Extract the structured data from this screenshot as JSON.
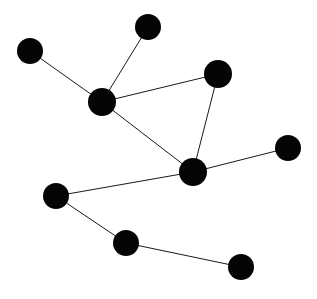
{
  "figure": {
    "type": "node-link-network-diagram",
    "width": 317,
    "height": 299,
    "background_color": "#ffffff",
    "node_color": "#050505",
    "edge_color": "#1a1a1a",
    "edge_width": 1,
    "node_count": 9,
    "edge_count": 9
  },
  "chart_data": {
    "type": "scatter",
    "title": "",
    "subtitle": "",
    "xlabel": "",
    "ylabel": "",
    "grid": false,
    "legend": "none",
    "xlim": [
      0,
      317
    ],
    "ylim": [
      0,
      299
    ],
    "graph_type": "undirected-network",
    "nodes": [
      {
        "id": "n1",
        "label": "",
        "x": 30,
        "y": 51,
        "r": 13,
        "degree": 1
      },
      {
        "id": "n2",
        "label": "",
        "x": 148,
        "y": 27,
        "r": 13,
        "degree": 1
      },
      {
        "id": "n3",
        "label": "",
        "x": 102,
        "y": 102,
        "r": 14,
        "degree": 4
      },
      {
        "id": "n4",
        "label": "",
        "x": 218,
        "y": 74,
        "r": 14,
        "degree": 2
      },
      {
        "id": "n5",
        "label": "",
        "x": 193,
        "y": 172,
        "r": 14,
        "degree": 4
      },
      {
        "id": "n6",
        "label": "",
        "x": 288,
        "y": 148,
        "r": 13,
        "degree": 1
      },
      {
        "id": "n7",
        "label": "",
        "x": 56,
        "y": 196,
        "r": 13,
        "degree": 2
      },
      {
        "id": "n8",
        "label": "",
        "x": 126,
        "y": 243,
        "r": 13,
        "degree": 2
      },
      {
        "id": "n9",
        "label": "",
        "x": 241,
        "y": 267,
        "r": 13,
        "degree": 1
      }
    ],
    "edges": [
      {
        "source": "n1",
        "target": "n3"
      },
      {
        "source": "n2",
        "target": "n3"
      },
      {
        "source": "n3",
        "target": "n4"
      },
      {
        "source": "n3",
        "target": "n5"
      },
      {
        "source": "n4",
        "target": "n5"
      },
      {
        "source": "n5",
        "target": "n6"
      },
      {
        "source": "n5",
        "target": "n7"
      },
      {
        "source": "n7",
        "target": "n8"
      },
      {
        "source": "n8",
        "target": "n9"
      }
    ]
  }
}
